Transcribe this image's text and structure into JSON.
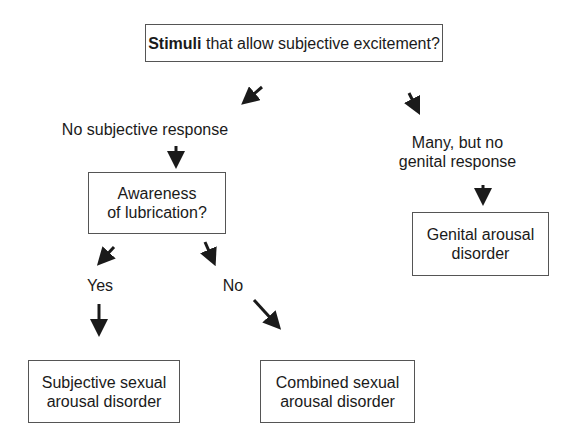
{
  "nodes": {
    "root": {
      "bold": "Stimuli",
      "text": " that allow subjective excitement?"
    },
    "no_subjective": "No subjective response",
    "many_no_genital": {
      "line1": "Many, but no",
      "line2": "genital response"
    },
    "awareness": {
      "line1": "Awareness",
      "line2": "of lubrication?"
    },
    "yes": "Yes",
    "no": "No",
    "genital_disorder": {
      "line1": "Genital arousal",
      "line2": "disorder"
    },
    "subjective_disorder": {
      "line1": "Subjective sexual",
      "line2": "arousal disorder"
    },
    "combined_disorder": {
      "line1": "Combined sexual",
      "line2": "arousal disorder"
    }
  },
  "edges": [
    {
      "from": "root",
      "to": "no_subjective"
    },
    {
      "from": "root",
      "to": "many_no_genital"
    },
    {
      "from": "no_subjective",
      "to": "awareness"
    },
    {
      "from": "many_no_genital",
      "to": "genital_disorder"
    },
    {
      "from": "awareness",
      "to": "yes"
    },
    {
      "from": "awareness",
      "to": "no"
    },
    {
      "from": "yes",
      "to": "subjective_disorder"
    },
    {
      "from": "no",
      "to": "combined_disorder"
    }
  ],
  "colors": {
    "line": "#1a1a1a",
    "border": "#555555",
    "background": "#ffffff"
  }
}
